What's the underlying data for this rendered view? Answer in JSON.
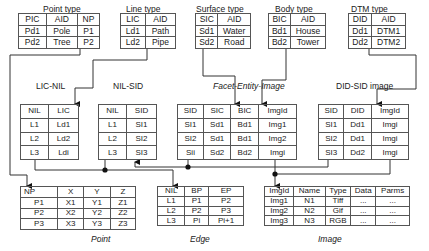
{
  "top_tables": [
    {
      "title": "Point type",
      "headers": [
        "PIC",
        "AID",
        "NP"
      ],
      "rows": [
        [
          "Pd1",
          "Pole",
          "P1"
        ],
        [
          "Pd2",
          "Tree",
          "P2"
        ]
      ]
    },
    {
      "title": "Line type",
      "headers": [
        "LIC",
        "AID"
      ],
      "rows": [
        [
          "Ld1",
          "Path"
        ],
        [
          "Ld2",
          "Pipe"
        ]
      ]
    },
    {
      "title": "Surface type",
      "headers": [
        "SIC",
        "AID"
      ],
      "rows": [
        [
          "Sd1",
          "Water"
        ],
        [
          "Sd2",
          "Road"
        ]
      ]
    },
    {
      "title": "Body type",
      "headers": [
        "BIC",
        "AID"
      ],
      "rows": [
        [
          "Bd1",
          "House"
        ],
        [
          "Bd2",
          "Tower"
        ]
      ]
    },
    {
      "title": "DTM type",
      "headers": [
        "DID",
        "AID"
      ],
      "rows": [
        [
          "Dd1",
          "DTM1"
        ],
        [
          "Dd2",
          "DTM2"
        ]
      ]
    }
  ],
  "mid_labels": {
    "lic_nil": "LIC-NIL",
    "nil_sid": "NIL-SID",
    "facet": "Facet-Entity-Image",
    "did_sid": "DID-SID image"
  },
  "mid_tables": [
    {
      "name": "LIC-NIL",
      "headers": [
        "NIL",
        "LIC"
      ],
      "rows": [
        [
          "L1",
          "Ld1"
        ],
        [
          "L2",
          "Ld2"
        ],
        [
          "L3",
          "Ldi"
        ]
      ]
    },
    {
      "name": "NIL-SID",
      "headers": [
        "NIL",
        "SID"
      ],
      "rows": [
        [
          "L1",
          "SI1"
        ],
        [
          "L2",
          "SI2"
        ],
        [
          "L3",
          "SI3"
        ]
      ]
    },
    {
      "name": "Facet-Entity-Image",
      "headers": [
        "SID",
        "SIC",
        "BIC",
        "ImgId"
      ],
      "rows": [
        [
          "SI1",
          "Sd1",
          "Bd1",
          "Img1"
        ],
        [
          "SI2",
          "Sd1",
          "Bd1",
          "Img2"
        ],
        [
          "Sii",
          "Sd2",
          "Bd2",
          "Imgi"
        ]
      ]
    },
    {
      "name": "DID-SID image",
      "headers": [
        "SID",
        "DID",
        "ImgId"
      ],
      "rows": [
        [
          "SI1",
          "Dd1",
          "Imgi"
        ],
        [
          "SI2",
          "Dd1",
          "Imgi"
        ],
        [
          "SI3",
          "Dd2",
          "Imgi"
        ]
      ]
    }
  ],
  "bottom_tables": [
    {
      "title": "Point",
      "headers": [
        "NP",
        "X",
        "Y",
        "Z"
      ],
      "rows": [
        [
          "P1",
          "X1",
          "Y1",
          "Z1"
        ],
        [
          "P2",
          "X2",
          "Y2",
          "Z2"
        ],
        [
          "P3",
          "X3",
          "Y3",
          "Z3"
        ]
      ]
    },
    {
      "title": "Edge",
      "headers": [
        "NIL",
        "BP",
        "EP"
      ],
      "rows": [
        [
          "L1",
          "P1",
          "P2"
        ],
        [
          "L2",
          "P2",
          "P3"
        ],
        [
          "L3",
          "Pi",
          "Pi+1"
        ]
      ]
    },
    {
      "title": "Image",
      "headers": [
        "ImgId",
        "Name",
        "Type",
        "Data",
        "Parms"
      ],
      "rows": [
        [
          "Img1",
          "N1",
          "Tiff",
          "...",
          "..."
        ],
        [
          "Img2",
          "N2",
          "Gif",
          "...",
          "..."
        ],
        [
          "Img3",
          "N3",
          "RGB",
          "...",
          "..."
        ]
      ]
    }
  ]
}
